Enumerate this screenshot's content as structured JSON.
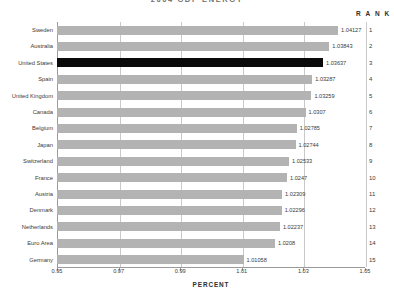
{
  "chart_data": {
    "type": "bar",
    "orientation": "horizontal",
    "title": "2004 GDP ENERGY",
    "xlabel": "PERCENT",
    "ylabel": "",
    "xlim": [
      0.95,
      1.05
    ],
    "xticks": [
      "0.95",
      "0.97",
      "0.99",
      "1.01",
      "1.03",
      "1.05"
    ],
    "xtick_values": [
      0.95,
      0.97,
      0.99,
      1.01,
      1.03,
      1.05
    ],
    "grid": true,
    "grid_axis": "x",
    "legend": "none",
    "rank_column_header": "R A N K",
    "highlight_category": "United States",
    "highlight_color": "#0a0a0a",
    "bar_color": "#b3b3b3",
    "categories": [
      "Sweden",
      "Australia",
      "United States",
      "Spain",
      "United Kingdom",
      "Canada",
      "Belgium",
      "Japan",
      "Switzerland",
      "France",
      "Austria",
      "Denmark",
      "Netherlands",
      "Euro Area",
      "Germany"
    ],
    "values": [
      1.04127,
      1.03843,
      1.03637,
      1.03287,
      1.03259,
      1.0307,
      1.02785,
      1.02744,
      1.02533,
      1.0247,
      1.02309,
      1.02296,
      1.02237,
      1.0208,
      1.01058
    ],
    "value_labels": [
      "1.04127",
      "1.03843",
      "1.03637",
      "1.03287",
      "1.03259",
      "1.0307",
      "1.02785",
      "1.02744",
      "1.02533",
      "1.0247",
      "1.02309",
      "1.02296",
      "1.02237",
      "1.0208",
      "1.01058"
    ],
    "ranks": [
      1,
      2,
      3,
      4,
      5,
      6,
      7,
      8,
      9,
      10,
      11,
      12,
      13,
      14,
      15
    ]
  }
}
